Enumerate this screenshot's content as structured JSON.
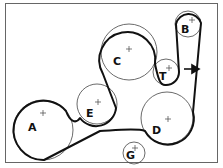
{
  "diagram": {
    "type": "serpentine-belt-routing",
    "pulleys": [
      {
        "id": "A",
        "label": "A"
      },
      {
        "id": "B",
        "label": "B"
      },
      {
        "id": "C",
        "label": "C"
      },
      {
        "id": "D",
        "label": "D"
      },
      {
        "id": "E",
        "label": "E"
      },
      {
        "id": "G",
        "label": "G"
      },
      {
        "id": "T",
        "label": "T"
      }
    ],
    "arrow": {
      "direction": "right",
      "meaning": "belt-tensioner-direction"
    }
  }
}
